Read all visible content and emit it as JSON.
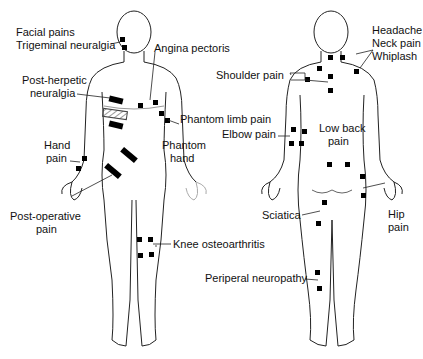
{
  "figure": {
    "views": [
      "front",
      "back"
    ]
  },
  "labels_front": {
    "facial_pains": "Facial pains",
    "trigeminal": "Trigeminal neuralgia",
    "angina": "Angina pectoris",
    "post_herpetic_1": "Post-herpetic",
    "post_herpetic_2": "neuralgia",
    "phantom_limb": "Phantom limb pain",
    "hand_pain_1": "Hand",
    "hand_pain_2": "pain",
    "phantom_hand_1": "Phantom",
    "phantom_hand_2": "hand",
    "post_op_1": "Post-operative",
    "post_op_2": "pain",
    "knee": "Knee osteoarthritis"
  },
  "labels_back": {
    "headache": "Headache",
    "neck_pain": "Neck pain",
    "whiplash": "Whiplash",
    "shoulder": "Shoulder pain",
    "elbow": "Elbow pain",
    "low_back_1": "Low back",
    "low_back_2": "pain",
    "sciatica": "Sciatica",
    "hip_1": "Hip",
    "hip_2": "pain",
    "peripheral": "Periperal neuropathy"
  },
  "colors": {
    "electrode": "#000000",
    "outline": "#222222",
    "text": "#111111"
  }
}
